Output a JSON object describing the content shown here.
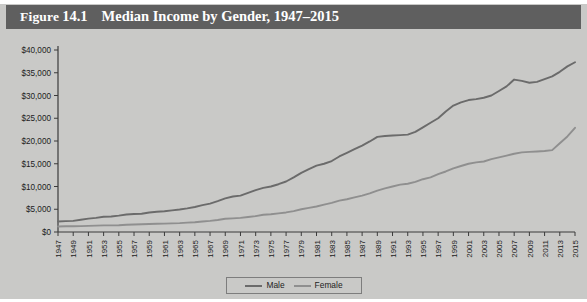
{
  "figure": {
    "label_prefix": "Figure",
    "number": "14.1",
    "title": "Median Income by Gender, 1947–2015"
  },
  "colors": {
    "title_bar_background": "#5f5f5f",
    "title_bar_text": "#ffffff",
    "panel_background": "#c9c9c7",
    "axis": "#3b3b3b",
    "male_line": "#6b6b6b",
    "female_line": "#8f8f8f"
  },
  "legend": {
    "position": "bottom-center",
    "entries": [
      {
        "label": "Male",
        "color": "#6b6b6b"
      },
      {
        "label": "Female",
        "color": "#8f8f8f"
      }
    ]
  },
  "chart_data": {
    "type": "line",
    "title": "Median Income by Gender, 1947–2015",
    "xlabel": "",
    "ylabel": "",
    "xlim": [
      1947,
      2015
    ],
    "ylim": [
      0,
      40000
    ],
    "grid": false,
    "legend_position": "bottom-center",
    "ytick_labels": [
      "$0",
      "$5,000",
      "$10,000",
      "$15,000",
      "$20,000",
      "$25,000",
      "$30,000",
      "$35,000",
      "$40,000"
    ],
    "ytick_values": [
      0,
      5000,
      10000,
      15000,
      20000,
      25000,
      30000,
      35000,
      40000
    ],
    "xtick_labels": [
      "1947",
      "1949",
      "1951",
      "1953",
      "1955",
      "1957",
      "1959",
      "1961",
      "1963",
      "1965",
      "1967",
      "1969",
      "1971",
      "1973",
      "1975",
      "1977",
      "1979",
      "1981",
      "1983",
      "1985",
      "1987",
      "1989",
      "1991",
      "1993",
      "1995",
      "1997",
      "1999",
      "2001",
      "2003",
      "2005",
      "2007",
      "2009",
      "2011",
      "2013",
      "2015"
    ],
    "x": [
      1947,
      1948,
      1949,
      1950,
      1951,
      1952,
      1953,
      1954,
      1955,
      1956,
      1957,
      1958,
      1959,
      1960,
      1961,
      1962,
      1963,
      1964,
      1965,
      1966,
      1967,
      1968,
      1969,
      1970,
      1971,
      1972,
      1973,
      1974,
      1975,
      1976,
      1977,
      1978,
      1979,
      1980,
      1981,
      1982,
      1983,
      1984,
      1985,
      1986,
      1987,
      1988,
      1989,
      1990,
      1991,
      1992,
      1993,
      1994,
      1995,
      1996,
      1997,
      1998,
      1999,
      2000,
      2001,
      2002,
      2003,
      2004,
      2005,
      2006,
      2007,
      2008,
      2009,
      2010,
      2011,
      2012,
      2013,
      2014,
      2015
    ],
    "series": [
      {
        "name": "Male",
        "color": "#6b6b6b",
        "values": [
          2300,
          2400,
          2450,
          2700,
          2950,
          3100,
          3350,
          3400,
          3600,
          3850,
          3950,
          4000,
          4300,
          4450,
          4550,
          4750,
          4950,
          5200,
          5500,
          5900,
          6250,
          6800,
          7400,
          7800,
          8000,
          8600,
          9200,
          9700,
          10000,
          10500,
          11100,
          12000,
          13000,
          13800,
          14600,
          15000,
          15600,
          16600,
          17400,
          18200,
          19000,
          19900,
          20900,
          21100,
          21200,
          21300,
          21400,
          22000,
          23000,
          24000,
          25000,
          26500,
          27800,
          28500,
          29000,
          29200,
          29500,
          30000,
          31000,
          32000,
          33500,
          33200,
          32800,
          33000,
          33600,
          34200,
          35200,
          36400,
          37300
        ]
      },
      {
        "name": "Female",
        "color": "#8f8f8f",
        "values": [
          1200,
          1250,
          1250,
          1300,
          1350,
          1400,
          1450,
          1450,
          1500,
          1600,
          1650,
          1700,
          1750,
          1800,
          1850,
          1900,
          1950,
          2050,
          2150,
          2300,
          2450,
          2650,
          2900,
          3000,
          3100,
          3300,
          3500,
          3800,
          3900,
          4100,
          4300,
          4600,
          5000,
          5300,
          5600,
          6000,
          6400,
          6900,
          7200,
          7600,
          8000,
          8500,
          9100,
          9600,
          10000,
          10400,
          10600,
          11000,
          11600,
          12000,
          12700,
          13300,
          14000,
          14500,
          15000,
          15300,
          15500,
          16000,
          16400,
          16800,
          17200,
          17500,
          17600,
          17700,
          17800,
          18000,
          19500,
          21000,
          22900
        ]
      }
    ]
  }
}
